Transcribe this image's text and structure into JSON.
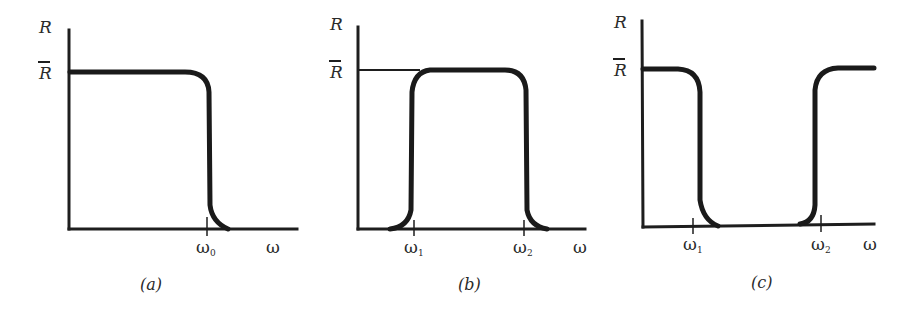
{
  "figure": {
    "panels": [
      {
        "id": "a",
        "caption": "(a)",
        "y_label": "R",
        "y_level_label": "R̄",
        "x_label": "ω",
        "ticks": [
          {
            "symbol": "ω",
            "sub": "0"
          }
        ],
        "description": "low-pass: R = R̄ for ω < ω0, drops to 0 above ω0"
      },
      {
        "id": "b",
        "caption": "(b)",
        "y_label": "R",
        "y_level_label": "R̄",
        "x_label": "ω",
        "ticks": [
          {
            "symbol": "ω",
            "sub": "1"
          },
          {
            "symbol": "ω",
            "sub": "2"
          }
        ],
        "description": "band-pass: R = R̄ for ω1 < ω < ω2, 0 elsewhere"
      },
      {
        "id": "c",
        "caption": "(c)",
        "y_label": "R",
        "y_level_label": "R̄",
        "x_label": "ω",
        "ticks": [
          {
            "symbol": "ω",
            "sub": "1"
          },
          {
            "symbol": "ω",
            "sub": "2"
          }
        ],
        "description": "band-stop: R = R̄ outside (ω1, ω2), 0 inside"
      }
    ]
  }
}
